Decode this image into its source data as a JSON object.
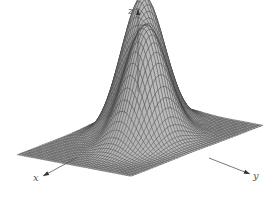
{
  "chart_data": {
    "type": "surface",
    "title": "",
    "axes": {
      "x": {
        "label": "x",
        "direction": "toward lower-left"
      },
      "y": {
        "label": "y",
        "direction": "toward lower-right"
      },
      "z": {
        "label": "z",
        "direction": "up"
      }
    },
    "ticks": "none",
    "grid": false,
    "legend": null,
    "surface": {
      "domain": {
        "u": [
          -3,
          3
        ],
        "v": [
          -3,
          3
        ]
      },
      "mesh_lines": 48,
      "peaks": [
        {
          "name": "left-peak",
          "center_u": -0.9,
          "center_v": -0.9,
          "height": 1.0,
          "width": 0.75
        },
        {
          "name": "right-peak",
          "center_u": 0.2,
          "center_v": 0.55,
          "height": 0.85,
          "width": 0.75
        }
      ],
      "fill_color": "#a9a9a9",
      "line_color": "#3a3a3a"
    },
    "projection": {
      "origin": [
        140,
        140
      ],
      "u_vec": [
        -22,
        8.5
      ],
      "v_vec": [
        19,
        3.6
      ],
      "z_scale": 128
    },
    "axis_arrows": {
      "x": {
        "from": [
          78,
          157
        ],
        "to": [
          43,
          176
        ],
        "label_pos": [
          33,
          181
        ]
      },
      "y": {
        "from": [
          209,
          158
        ],
        "to": [
          250,
          174
        ],
        "label_pos": [
          253,
          179
        ]
      },
      "z": {
        "from": [
          138,
          92
        ],
        "to": [
          138,
          9
        ],
        "label_pos": [
          128,
          14
        ]
      }
    }
  }
}
